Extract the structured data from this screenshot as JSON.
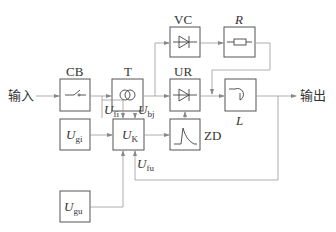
{
  "diagram": {
    "input_label": "输入",
    "output_label": "输出",
    "blocks": {
      "cb": {
        "label": "CB",
        "icon": "switch-icon"
      },
      "t": {
        "label": "T",
        "icon": "transformer-icon"
      },
      "vc": {
        "label": "VC",
        "icon": "diode-icon"
      },
      "r": {
        "label": "R",
        "icon": "resistor-icon"
      },
      "ur": {
        "label": "UR",
        "icon": "diode-icon"
      },
      "l": {
        "label": "L",
        "icon": "inductor-icon"
      },
      "ugi": {
        "label_main": "U",
        "label_sub": "gi"
      },
      "uk": {
        "label_main": "U",
        "label_sub": "K"
      },
      "zd": {
        "label": "ZD",
        "icon": "pulse-icon"
      },
      "ugu": {
        "label_main": "U",
        "label_sub": "gu"
      }
    },
    "signals": {
      "ufi": {
        "main": "U",
        "sub": "fi"
      },
      "ubj": {
        "main": "U",
        "sub": "bj"
      },
      "ufu": {
        "main": "U",
        "sub": "fu"
      }
    }
  }
}
